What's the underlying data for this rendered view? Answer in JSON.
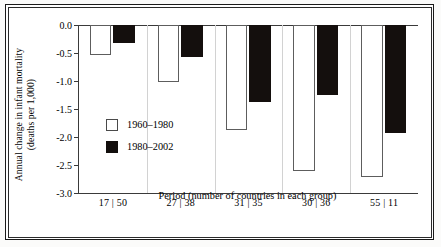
{
  "chart_data": {
    "type": "bar",
    "title": "",
    "xlabel": "Period (number of countries in each group)",
    "ylabel_line1": "Annual change in infant mortality",
    "ylabel_line2": "(deaths per 1,000)",
    "categories": [
      "17 | 50",
      "27 | 38",
      "31 | 35",
      "30 | 36",
      "55 | 11"
    ],
    "series": [
      {
        "name": "1960–1980",
        "color": "#ffffff",
        "values": [
          -0.53,
          -1.02,
          -1.87,
          -2.6,
          -2.72
        ]
      },
      {
        "name": "1980–2002",
        "color": "#120e0c",
        "values": [
          -0.32,
          -0.58,
          -1.38,
          -1.25,
          -1.93
        ]
      }
    ],
    "ylim": [
      -3.0,
      0.0
    ],
    "yticks": [
      0.0,
      -0.5,
      -1.0,
      -1.5,
      -2.0,
      -2.5,
      -3.0
    ],
    "ytick_labels": [
      "0.0",
      "-0.5",
      "-1.0",
      "-1.5",
      "-2.0",
      "-2.5",
      "-3.0"
    ],
    "grid": "vertical-separators-only",
    "legend_position": "inside-lower-left"
  },
  "legend": {
    "items": [
      {
        "label": "1960–1980",
        "swatch": "white-square"
      },
      {
        "label": "1980–2002",
        "swatch": "black-square"
      }
    ]
  },
  "axes": {
    "y_title_line1": "Annual change in infant mortality",
    "y_title_line2": "(deaths per 1,000)",
    "x_title": "Period (number of countries in each group)",
    "y_tick_labels": [
      "0.0",
      "-0.5",
      "-1.0",
      "-1.5",
      "-2.0",
      "-2.5",
      "-3.0"
    ],
    "x_tick_labels": [
      "17 | 50",
      "27 | 38",
      "31 | 35",
      "30 | 36",
      "55 | 11"
    ]
  }
}
